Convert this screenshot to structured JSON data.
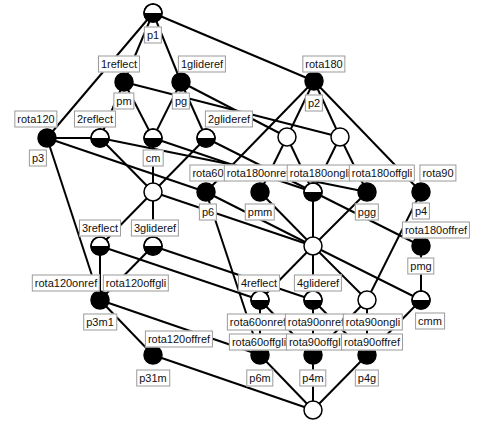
{
  "diagram": {
    "nodes": [
      {
        "id": "n_p1",
        "x": 153,
        "y": 13,
        "fill": "half"
      },
      {
        "id": "n_pm",
        "x": 124,
        "y": 82,
        "fill": "black"
      },
      {
        "id": "n_pg",
        "x": 181,
        "y": 82,
        "fill": "black"
      },
      {
        "id": "n_p2",
        "x": 314,
        "y": 81,
        "fill": "black"
      },
      {
        "id": "n_p3",
        "x": 47,
        "y": 138,
        "fill": "black"
      },
      {
        "id": "n_2r",
        "x": 100,
        "y": 138,
        "fill": "half"
      },
      {
        "id": "n_cm",
        "x": 153,
        "y": 138,
        "fill": "half"
      },
      {
        "id": "n_2g",
        "x": 206,
        "y": 138,
        "fill": "half"
      },
      {
        "id": "n_w1",
        "x": 287,
        "y": 137,
        "fill": "white"
      },
      {
        "id": "n_w2",
        "x": 340,
        "y": 137,
        "fill": "white"
      },
      {
        "id": "n_w3",
        "x": 153,
        "y": 192,
        "fill": "white"
      },
      {
        "id": "n_p6",
        "x": 206,
        "y": 192,
        "fill": "black"
      },
      {
        "id": "n_pmm",
        "x": 260,
        "y": 192,
        "fill": "black"
      },
      {
        "id": "n_r180g",
        "x": 313,
        "y": 192,
        "fill": "half"
      },
      {
        "id": "n_pgg",
        "x": 367,
        "y": 192,
        "fill": "black"
      },
      {
        "id": "n_p4",
        "x": 421,
        "y": 192,
        "fill": "black"
      },
      {
        "id": "n_c",
        "x": 313,
        "y": 246,
        "fill": "white"
      },
      {
        "id": "n_pmg",
        "x": 421,
        "y": 246,
        "fill": "black"
      },
      {
        "id": "n_3r",
        "x": 100,
        "y": 246,
        "fill": "half"
      },
      {
        "id": "n_3g",
        "x": 153,
        "y": 246,
        "fill": "half"
      },
      {
        "id": "n_4r",
        "x": 260,
        "y": 300,
        "fill": "half"
      },
      {
        "id": "n_4g",
        "x": 313,
        "y": 300,
        "fill": "half"
      },
      {
        "id": "n_w4",
        "x": 367,
        "y": 300,
        "fill": "white"
      },
      {
        "id": "n_cmm",
        "x": 421,
        "y": 300,
        "fill": "half"
      },
      {
        "id": "n_p3m1",
        "x": 100,
        "y": 300,
        "fill": "black"
      },
      {
        "id": "n_p31m",
        "x": 153,
        "y": 355,
        "fill": "black"
      },
      {
        "id": "n_p6m",
        "x": 260,
        "y": 355,
        "fill": "black"
      },
      {
        "id": "n_p4m",
        "x": 313,
        "y": 355,
        "fill": "black"
      },
      {
        "id": "n_p4g",
        "x": 367,
        "y": 355,
        "fill": "black"
      },
      {
        "id": "n_bot",
        "x": 313,
        "y": 410,
        "fill": "white"
      }
    ],
    "edges": [
      [
        "n_p1",
        "n_pm"
      ],
      [
        "n_p1",
        "n_pg"
      ],
      [
        "n_p1",
        "n_p2"
      ],
      [
        "n_p1",
        "n_p3"
      ],
      [
        "n_pm",
        "n_2r"
      ],
      [
        "n_pm",
        "n_cm"
      ],
      [
        "n_pm",
        "n_w2"
      ],
      [
        "n_pg",
        "n_cm"
      ],
      [
        "n_pg",
        "n_2g"
      ],
      [
        "n_pg",
        "n_w1"
      ],
      [
        "n_p2",
        "n_w1"
      ],
      [
        "n_p2",
        "n_w2"
      ],
      [
        "n_p2",
        "n_p6"
      ],
      [
        "n_p2",
        "n_p4"
      ],
      [
        "n_p3",
        "n_2r"
      ],
      [
        "n_p3",
        "n_p6"
      ],
      [
        "n_p3",
        "n_p3m1"
      ],
      [
        "n_2r",
        "n_w3"
      ],
      [
        "n_2r",
        "n_pgg"
      ],
      [
        "n_cm",
        "n_w3"
      ],
      [
        "n_cm",
        "n_r180g"
      ],
      [
        "n_2g",
        "n_w3"
      ],
      [
        "n_2g",
        "n_pmg"
      ],
      [
        "n_w1",
        "n_pmm"
      ],
      [
        "n_w1",
        "n_r180g"
      ],
      [
        "n_w2",
        "n_r180g"
      ],
      [
        "n_w2",
        "n_pgg"
      ],
      [
        "n_w3",
        "n_3r"
      ],
      [
        "n_w3",
        "n_3g"
      ],
      [
        "n_w3",
        "n_c"
      ],
      [
        "n_p6",
        "n_c"
      ],
      [
        "n_p6",
        "n_p6m"
      ],
      [
        "n_pmm",
        "n_c"
      ],
      [
        "n_pgg",
        "n_c"
      ],
      [
        "n_r180g",
        "n_c"
      ],
      [
        "n_p4",
        "n_w4"
      ],
      [
        "n_pmg",
        "n_cmm"
      ],
      [
        "n_c",
        "n_4r"
      ],
      [
        "n_c",
        "n_4g"
      ],
      [
        "n_c",
        "n_w4"
      ],
      [
        "n_c",
        "n_cmm"
      ],
      [
        "n_3r",
        "n_p3m1"
      ],
      [
        "n_3r",
        "n_4r"
      ],
      [
        "n_3g",
        "n_p3m1"
      ],
      [
        "n_3g",
        "n_4g"
      ],
      [
        "n_p3m1",
        "n_p31m"
      ],
      [
        "n_p3m1",
        "n_p6m"
      ],
      [
        "n_4r",
        "n_p6m"
      ],
      [
        "n_4r",
        "n_p4m"
      ],
      [
        "n_4g",
        "n_p4m"
      ],
      [
        "n_4g",
        "n_p4g"
      ],
      [
        "n_w4",
        "n_p4m"
      ],
      [
        "n_w4",
        "n_p4g"
      ],
      [
        "n_cmm",
        "n_p4g"
      ],
      [
        "n_p31m",
        "n_bot"
      ],
      [
        "n_p6m",
        "n_bot"
      ],
      [
        "n_p4m",
        "n_bot"
      ],
      [
        "n_p4g",
        "n_bot"
      ]
    ],
    "labels": [
      {
        "text": "p1",
        "x": 153,
        "y": 35
      },
      {
        "text": "1reflect",
        "x": 119,
        "y": 64
      },
      {
        "text": "1glideref",
        "x": 202,
        "y": 64
      },
      {
        "text": "pm",
        "x": 124,
        "y": 101
      },
      {
        "text": "pg",
        "x": 181,
        "y": 101
      },
      {
        "text": "rota180",
        "x": 324,
        "y": 64
      },
      {
        "text": "p2",
        "x": 314,
        "y": 103
      },
      {
        "text": "rota120",
        "x": 36,
        "y": 119
      },
      {
        "text": "p3",
        "x": 38,
        "y": 158
      },
      {
        "text": "2reflect",
        "x": 95,
        "y": 119
      },
      {
        "text": "cm",
        "x": 153,
        "y": 158
      },
      {
        "text": "2glideref",
        "x": 229,
        "y": 119
      },
      {
        "text": "rota60",
        "x": 208,
        "y": 173
      },
      {
        "text": "rota180onref",
        "x": 258,
        "y": 173
      },
      {
        "text": "rota180ongli",
        "x": 320,
        "y": 173
      },
      {
        "text": "rota180offgli",
        "x": 382,
        "y": 173
      },
      {
        "text": "rota90",
        "x": 438,
        "y": 173
      },
      {
        "text": "p6",
        "x": 208,
        "y": 212
      },
      {
        "text": "pmm",
        "x": 260,
        "y": 212
      },
      {
        "text": "pgg",
        "x": 367,
        "y": 212
      },
      {
        "text": "p4",
        "x": 421,
        "y": 211
      },
      {
        "text": "rota180offref",
        "x": 436,
        "y": 230
      },
      {
        "text": "pmg",
        "x": 421,
        "y": 266
      },
      {
        "text": "3reflect",
        "x": 100,
        "y": 228
      },
      {
        "text": "3glideref",
        "x": 155,
        "y": 228
      },
      {
        "text": "rota120onref",
        "x": 66,
        "y": 283
      },
      {
        "text": "rota120offgli",
        "x": 136,
        "y": 283
      },
      {
        "text": "p3m1",
        "x": 100,
        "y": 322
      },
      {
        "text": "4reflect",
        "x": 259,
        "y": 283
      },
      {
        "text": "4glideref",
        "x": 318,
        "y": 283
      },
      {
        "text": "rota60onref",
        "x": 258,
        "y": 322
      },
      {
        "text": "rota90onref",
        "x": 316,
        "y": 322
      },
      {
        "text": "rota90ongli",
        "x": 373,
        "y": 322
      },
      {
        "text": "cmm",
        "x": 430,
        "y": 321
      },
      {
        "text": "rota120offref",
        "x": 179,
        "y": 339
      },
      {
        "text": "rota60offgli",
        "x": 259,
        "y": 342
      },
      {
        "text": "rota90offgli",
        "x": 316,
        "y": 342
      },
      {
        "text": "rota90offref",
        "x": 372,
        "y": 342
      },
      {
        "text": "p31m",
        "x": 153,
        "y": 378
      },
      {
        "text": "p6m",
        "x": 260,
        "y": 378
      },
      {
        "text": "p4m",
        "x": 313,
        "y": 378
      },
      {
        "text": "p4g",
        "x": 367,
        "y": 378
      }
    ]
  }
}
